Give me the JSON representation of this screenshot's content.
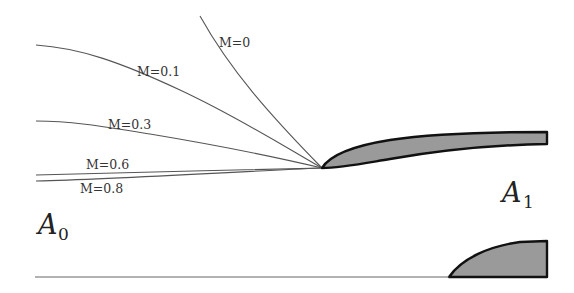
{
  "diagram": {
    "type": "stagnation-streamline-capture",
    "colors": {
      "background": "#ffffff",
      "streamline": "#555555",
      "body_fill": "#9a9a9a",
      "body_outline": "#111111",
      "wall": "#666666"
    },
    "streamlines": [
      {
        "id": "m0",
        "label": "M=0",
        "label_x": 219,
        "label_y": 47
      },
      {
        "id": "m01",
        "label": "M=0.1",
        "label_x": 137,
        "label_y": 76
      },
      {
        "id": "m03",
        "label": "M=0.3",
        "label_x": 108,
        "label_y": 129
      },
      {
        "id": "m06",
        "label": "M=0.6",
        "label_x": 86,
        "label_y": 169
      },
      {
        "id": "m08",
        "label": "M=0.8",
        "label_x": 80,
        "label_y": 193
      }
    ],
    "areas": {
      "a0": {
        "symbol": "A",
        "subscript": "0"
      },
      "a1": {
        "symbol": "A",
        "subscript": "1"
      }
    }
  }
}
